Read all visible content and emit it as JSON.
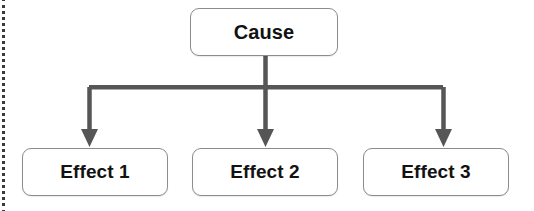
{
  "diagram": {
    "type": "cause-and-effect",
    "canvas": {
      "width": 534,
      "height": 211,
      "background": "#ffffff"
    },
    "colors": {
      "connector": "#565656",
      "box_border": "#8c8c8c",
      "box_fill": "#ffffff",
      "text": "#121212",
      "margin_rule": "#3a3a3a"
    },
    "cause": {
      "label": "Cause"
    },
    "effects": [
      {
        "label": "Effect 1"
      },
      {
        "label": "Effect 2"
      },
      {
        "label": "Effect 3"
      }
    ]
  }
}
